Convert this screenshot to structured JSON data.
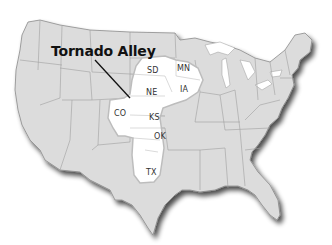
{
  "map": {
    "title": "Tornado Alley",
    "region_labels": [
      {
        "abbr": "SD",
        "x": 152,
        "y": 69
      },
      {
        "abbr": "MN",
        "x": 178,
        "y": 66
      },
      {
        "abbr": "NE",
        "x": 146,
        "y": 91
      },
      {
        "abbr": "IA",
        "x": 181,
        "y": 86
      },
      {
        "abbr": "CO",
        "x": 114,
        "y": 111
      },
      {
        "abbr": "KS",
        "x": 149,
        "y": 115
      },
      {
        "abbr": "OK",
        "x": 154,
        "y": 133
      },
      {
        "abbr": "TX",
        "x": 145,
        "y": 172
      }
    ],
    "colors": {
      "land": "#dcdcdc",
      "highlight": "#ffffff",
      "border": "#9a9a9a",
      "shadow": "#555555",
      "pointer": "#111111"
    }
  }
}
